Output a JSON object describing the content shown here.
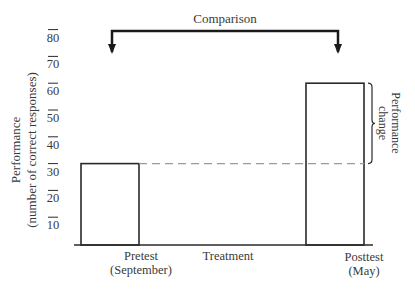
{
  "chart_data": {
    "type": "bar",
    "title": "",
    "categories": [
      "Pretest (September)",
      "Posttest (May)"
    ],
    "category_lines": [
      [
        "Pretest",
        "(September)"
      ],
      [
        "Posttest",
        "(May)"
      ]
    ],
    "values": [
      30,
      60
    ],
    "xlabel": "",
    "ylabel_lines": [
      "Performance",
      "(number of correct responses)"
    ],
    "yticks": [
      10,
      20,
      30,
      40,
      50,
      60,
      70,
      80
    ],
    "ylim": [
      0,
      90
    ],
    "grid": false,
    "legend": null,
    "annotations": {
      "comparison": "Comparison",
      "treatment": "Treatment",
      "performance_change_lines": [
        "Performance",
        "change"
      ],
      "dashed_reference_value": 30
    }
  },
  "colors": {
    "ink": "#2a2a2a",
    "text": "#3a3a3a",
    "dashed": "#9a9a9a",
    "background": "#ffffff"
  }
}
